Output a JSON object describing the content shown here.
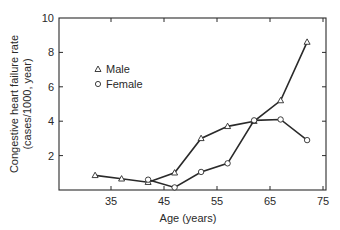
{
  "chart_data": {
    "type": "line",
    "title": "",
    "xlabel": "Age (years)",
    "ylabel": "Congestive heart failure rate (cases/1000, year)",
    "ylabel_lines": [
      "Congestive heart failure rate",
      "(cases/1000, year)"
    ],
    "xlim": [
      25,
      75
    ],
    "ylim": [
      0,
      10
    ],
    "xticks": [
      35,
      45,
      55,
      65,
      75
    ],
    "yticks": [
      2,
      4,
      6,
      8,
      10
    ],
    "grid": false,
    "legend_position": "upper left",
    "series": [
      {
        "name": "Male",
        "marker": "triangle",
        "x": [
          32,
          37,
          42,
          47,
          52,
          57,
          62,
          67,
          72
        ],
        "values": [
          0.85,
          0.65,
          0.45,
          1.0,
          3.0,
          3.7,
          4.0,
          5.2,
          8.6
        ]
      },
      {
        "name": "Female",
        "marker": "circle",
        "x": [
          42,
          47,
          52,
          57,
          62,
          67,
          72
        ],
        "values": [
          0.6,
          0.15,
          1.05,
          1.55,
          4.05,
          4.1,
          2.9
        ]
      }
    ]
  },
  "legend": {
    "male_label": "Male",
    "female_label": "Female"
  },
  "axes": {
    "x_title": "Age (years)",
    "y_title_line1": "Congestive heart failure rate",
    "y_title_line2": "(cases/1000, year)"
  }
}
